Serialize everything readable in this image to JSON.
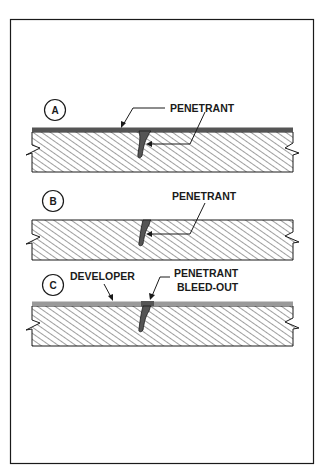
{
  "figure": {
    "title": "",
    "colors": {
      "outline": "#1a1a1a",
      "penetrant": "#555555",
      "developer": "#9a9a9a",
      "hatch": "#2a2a2a",
      "background": "#ffffff"
    },
    "panels": [
      {
        "id": "A",
        "marker": "A",
        "labels": [
          {
            "text": "PENETRANT"
          }
        ],
        "description": "Penetrant applied over surface, entering crack"
      },
      {
        "id": "B",
        "marker": "B",
        "labels": [
          {
            "text": "PENETRANT"
          }
        ],
        "description": "Excess surface penetrant removed; penetrant remains in crack"
      },
      {
        "id": "C",
        "marker": "C",
        "labels": [
          {
            "text": "DEVELOPER"
          },
          {
            "line1": "PENETRANT",
            "line2": "BLEED-OUT"
          }
        ],
        "description": "Developer applied; penetrant bleeds out of crack"
      }
    ]
  }
}
